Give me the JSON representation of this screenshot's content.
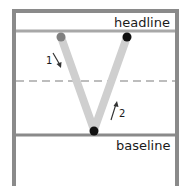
{
  "diagram": {
    "labels": {
      "headline": "headline",
      "baseline": "baseline"
    },
    "strokes": [
      {
        "number": "1",
        "direction": "down",
        "from": "headline-left",
        "to": "baseline-center"
      },
      {
        "number": "2",
        "direction": "up",
        "from": "baseline-center",
        "to": "headline-right"
      }
    ],
    "points": {
      "start": {
        "color": "#808080"
      },
      "vertex": {
        "color": "#111111"
      },
      "end": {
        "color": "#111111"
      }
    },
    "colors": {
      "frame": "#8a8a8a",
      "guide_lines": "#a8a8a8",
      "dashed_midline": "#bdbdbd",
      "stroke": "#cfcfcf",
      "arrow": "#333333"
    }
  }
}
